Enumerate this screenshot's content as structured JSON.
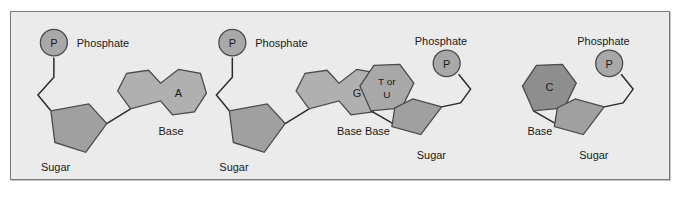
{
  "figure": {
    "panel_background": "#ebebeb",
    "panel_border": "#7a7a7a",
    "page_background": "#ffffff",
    "bond_color": "#2b2b2b",
    "text_color": "#1a1a1a"
  },
  "palette": {
    "phosphate_fill": "#a8a8a8",
    "sugar_fill": "#a0a0a0",
    "purine_fill": "#b0b0b0",
    "pyrimidine_light_fill": "#a8a8a8",
    "pyrimidine_dark_fill": "#8e8e8e",
    "shape_stroke": "#4a4a4a"
  },
  "labels": {
    "phosphate": "Phosphate",
    "sugar": "Sugar",
    "base": "Base",
    "phosphate_glyph": "P"
  },
  "nucleotides": [
    {
      "id": "adenine",
      "base_letter": "A",
      "base_letter_lines": [
        "A"
      ],
      "base_type": "purine",
      "base_fill": "#b0b0b0",
      "phosphate_label": "Phosphate",
      "sugar_label": "Sugar",
      "base_label": "Base",
      "phosphate_glyph": "P",
      "orientation": "phosphate-left"
    },
    {
      "id": "guanine",
      "base_letter": "G",
      "base_letter_lines": [
        "G"
      ],
      "base_type": "purine",
      "base_fill": "#b0b0b0",
      "phosphate_label": "Phosphate",
      "sugar_label": "Sugar",
      "base_label": "Base",
      "phosphate_glyph": "P",
      "orientation": "phosphate-left"
    },
    {
      "id": "thymine-uracil",
      "base_letter": "T or U",
      "base_letter_lines": [
        "T or",
        "U"
      ],
      "base_type": "pyrimidine",
      "base_fill": "#a8a8a8",
      "phosphate_label": "Phosphate",
      "sugar_label": "Sugar",
      "base_label": "Base",
      "phosphate_glyph": "P",
      "orientation": "phosphate-right"
    },
    {
      "id": "cytosine",
      "base_letter": "C",
      "base_letter_lines": [
        "C"
      ],
      "base_type": "pyrimidine",
      "base_fill": "#8e8e8e",
      "phosphate_label": "Phosphate",
      "sugar_label": "Sugar",
      "base_label": "Base",
      "phosphate_glyph": "P",
      "orientation": "phosphate-right"
    }
  ]
}
